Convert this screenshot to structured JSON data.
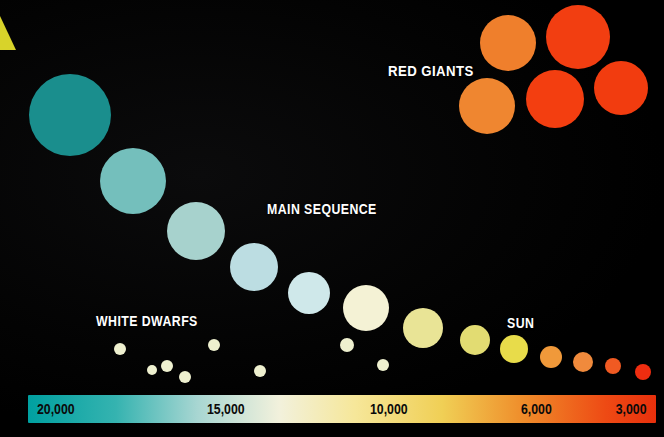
{
  "figure": {
    "type": "hr-diagram",
    "background_color": "#000000",
    "width": 664,
    "height": 437
  },
  "labels": [
    {
      "name": "red-giants",
      "text": "RED GIANTS",
      "x": 388,
      "y": 62,
      "font_size": 15,
      "color": "#ffffff"
    },
    {
      "name": "main-sequence",
      "text": "MAIN SEQUENCE",
      "x": 267,
      "y": 201,
      "font_size": 14,
      "color": "#ffffff"
    },
    {
      "name": "white-dwarfs",
      "text": "WHITE DWARFS",
      "x": 96,
      "y": 313,
      "font_size": 14,
      "color": "#ffffff"
    },
    {
      "name": "sun",
      "text": "SUN",
      "x": 507,
      "y": 315,
      "font_size": 14,
      "color": "#ffffff"
    }
  ],
  "corner_wedge": {
    "name": "yellow-corner-wedge",
    "color": "#d8d32a",
    "x": 0,
    "y": 16,
    "width": 16,
    "height": 34
  },
  "scale_bar": {
    "name": "temperature-scale-bar",
    "x": 28,
    "y": 395,
    "width": 628,
    "height": 28,
    "gradient_stops": [
      {
        "pos": 0,
        "color": "#00a0a0"
      },
      {
        "pos": 14,
        "color": "#35b3b0"
      },
      {
        "pos": 27,
        "color": "#a8d6d2"
      },
      {
        "pos": 40,
        "color": "#f2f1dc"
      },
      {
        "pos": 52,
        "color": "#f6e79a"
      },
      {
        "pos": 66,
        "color": "#f0cf55"
      },
      {
        "pos": 79,
        "color": "#ef8c2a"
      },
      {
        "pos": 92,
        "color": "#ee4a14"
      },
      {
        "pos": 100,
        "color": "#e8300c"
      }
    ],
    "ticks": [
      {
        "name": "tick-20000",
        "text": "20,000",
        "pct": 1.5,
        "align": "left"
      },
      {
        "name": "tick-15000",
        "text": "15,000",
        "pct": 28.5,
        "align": "left"
      },
      {
        "name": "tick-10000",
        "text": "10,000",
        "pct": 54.5,
        "align": "left"
      },
      {
        "name": "tick-6000",
        "text": "6,000",
        "pct": 78.5,
        "align": "left"
      },
      {
        "name": "tick-3000",
        "text": "3,000",
        "pct": 98.5,
        "align": "right"
      }
    ]
  },
  "chart_data": {
    "type": "scatter",
    "xlabel": "Surface temperature (Kelvin)",
    "ylabel": "",
    "xlim": [
      20000,
      3000
    ],
    "x_reversed": true,
    "grid": false,
    "legend_position": "none",
    "axis_tick_labels": [
      "20,000",
      "15,000",
      "10,000",
      "6,000",
      "3,000"
    ],
    "annotations": [
      "RED GIANTS",
      "MAIN SEQUENCE",
      "WHITE DWARFS",
      "SUN"
    ],
    "groups": [
      {
        "name": "MAIN SEQUENCE",
        "points": [
          {
            "name": "main-sequence-star-1",
            "cx": 70,
            "cy": 115,
            "r": 41,
            "color": "#1a8e8d"
          },
          {
            "name": "main-sequence-star-2",
            "cx": 133,
            "cy": 181,
            "r": 33,
            "color": "#74bfbc"
          },
          {
            "name": "main-sequence-star-3",
            "cx": 196,
            "cy": 231,
            "r": 29,
            "color": "#a7d2cd"
          },
          {
            "name": "main-sequence-star-4",
            "cx": 254,
            "cy": 267,
            "r": 24,
            "color": "#bcdde2"
          },
          {
            "name": "main-sequence-star-5",
            "cx": 309,
            "cy": 293,
            "r": 21,
            "color": "#cfe8ea"
          },
          {
            "name": "main-sequence-star-6",
            "cx": 366,
            "cy": 308,
            "r": 23,
            "color": "#f4f2d5"
          },
          {
            "name": "main-sequence-star-7",
            "cx": 423,
            "cy": 328,
            "r": 20,
            "color": "#e9e496"
          },
          {
            "name": "main-sequence-star-8",
            "cx": 475,
            "cy": 340,
            "r": 15,
            "color": "#e2dc72"
          },
          {
            "name": "main-sequence-star-9-sun",
            "cx": 514,
            "cy": 349,
            "r": 14,
            "color": "#e8dc4a"
          },
          {
            "name": "main-sequence-star-10",
            "cx": 551,
            "cy": 357,
            "r": 11,
            "color": "#f0993a"
          },
          {
            "name": "main-sequence-star-11",
            "cx": 583,
            "cy": 362,
            "r": 10,
            "color": "#f08a3c"
          },
          {
            "name": "main-sequence-star-12",
            "cx": 613,
            "cy": 366,
            "r": 8,
            "color": "#f05a22"
          },
          {
            "name": "main-sequence-star-13",
            "cx": 643,
            "cy": 372,
            "r": 8,
            "color": "#ef2d10"
          }
        ]
      },
      {
        "name": "RED GIANTS",
        "points": [
          {
            "name": "red-giant-1",
            "cx": 508,
            "cy": 43,
            "r": 28,
            "color": "#ef7f2c"
          },
          {
            "name": "red-giant-2",
            "cx": 578,
            "cy": 37,
            "r": 32,
            "color": "#f23e11"
          },
          {
            "name": "red-giant-3",
            "cx": 487,
            "cy": 106,
            "r": 28,
            "color": "#ef8630"
          },
          {
            "name": "red-giant-4",
            "cx": 555,
            "cy": 99,
            "r": 29,
            "color": "#f33e10"
          },
          {
            "name": "red-giant-5",
            "cx": 621,
            "cy": 88,
            "r": 27,
            "color": "#f23c0f"
          }
        ]
      },
      {
        "name": "WHITE DWARFS",
        "points": [
          {
            "name": "white-dwarf-1",
            "cx": 120,
            "cy": 349,
            "r": 6,
            "color": "#eef0cf"
          },
          {
            "name": "white-dwarf-2",
            "cx": 167,
            "cy": 366,
            "r": 6,
            "color": "#eef0cf"
          },
          {
            "name": "white-dwarf-3",
            "cx": 152,
            "cy": 370,
            "r": 5,
            "color": "#eef0cf"
          },
          {
            "name": "white-dwarf-4",
            "cx": 185,
            "cy": 377,
            "r": 6,
            "color": "#eef0cf"
          },
          {
            "name": "white-dwarf-5",
            "cx": 214,
            "cy": 345,
            "r": 6,
            "color": "#eef0cf"
          },
          {
            "name": "white-dwarf-6",
            "cx": 260,
            "cy": 371,
            "r": 6,
            "color": "#eef0cf"
          },
          {
            "name": "white-dwarf-7",
            "cx": 347,
            "cy": 345,
            "r": 7,
            "color": "#eef0cf"
          },
          {
            "name": "white-dwarf-8",
            "cx": 383,
            "cy": 365,
            "r": 6,
            "color": "#eef0cf"
          }
        ]
      }
    ]
  }
}
